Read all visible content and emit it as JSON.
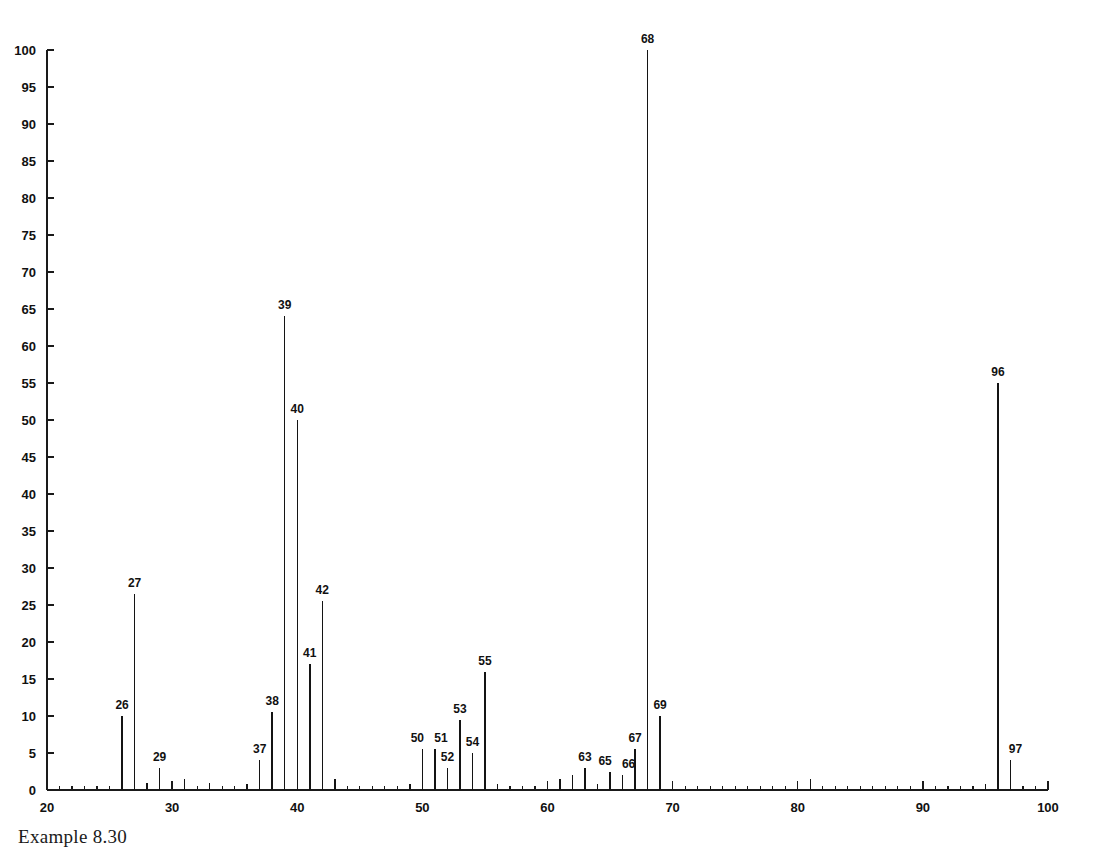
{
  "figure": {
    "caption": "Example 8.30",
    "background_color": "#ffffff",
    "trace_color": "#141414",
    "axis_color": "#1a1a1a"
  },
  "chart_data": {
    "type": "bar",
    "subtype": "mass-spectrum-stick-plot",
    "title": "",
    "subtitle": "",
    "xlabel": "",
    "ylabel": "",
    "xlim": [
      20,
      100
    ],
    "ylim": [
      0,
      100
    ],
    "grid": false,
    "legend": null,
    "x_major_ticks": [
      20,
      30,
      40,
      50,
      60,
      70,
      80,
      90,
      100
    ],
    "x_major_tick_labels": [
      "20",
      "30",
      "40",
      "50",
      "60",
      "70",
      "80",
      "90",
      "100"
    ],
    "x_minor_tick_step": 1,
    "y_major_ticks": [
      0,
      5,
      10,
      15,
      20,
      25,
      30,
      35,
      40,
      45,
      50,
      55,
      60,
      65,
      70,
      75,
      80,
      85,
      90,
      95,
      100
    ],
    "y_major_tick_labels": [
      "0",
      "5",
      "10",
      "15",
      "20",
      "25",
      "30",
      "35",
      "40",
      "45",
      "50",
      "55",
      "60",
      "65",
      "70",
      "75",
      "80",
      "85",
      "90",
      "95",
      "100"
    ],
    "base_peak_mz": 68,
    "molecular_ion_mz": 96,
    "x": [
      26,
      27,
      28,
      29,
      31,
      33,
      36,
      37,
      38,
      39,
      40,
      41,
      42,
      43,
      49,
      50,
      51,
      52,
      53,
      54,
      55,
      56,
      61,
      62,
      63,
      64,
      65,
      66,
      67,
      68,
      69,
      81,
      95,
      96,
      97
    ],
    "values": [
      10.0,
      26.5,
      1.0,
      3.0,
      1.5,
      1.0,
      0.8,
      4.0,
      10.5,
      64.0,
      50.0,
      17.0,
      25.5,
      1.5,
      0.8,
      5.5,
      5.5,
      3.0,
      9.5,
      5.0,
      16.0,
      0.8,
      1.5,
      2.0,
      3.0,
      0.8,
      2.5,
      2.0,
      5.5,
      100.0,
      10.0,
      1.5,
      0.8,
      55.0,
      4.0
    ],
    "labeled_peaks": [
      {
        "mz": 26,
        "intensity": 10.0,
        "label": "26"
      },
      {
        "mz": 27,
        "intensity": 26.5,
        "label": "27"
      },
      {
        "mz": 29,
        "intensity": 3.0,
        "label": "29"
      },
      {
        "mz": 37,
        "intensity": 4.0,
        "label": "37"
      },
      {
        "mz": 38,
        "intensity": 10.5,
        "label": "38"
      },
      {
        "mz": 39,
        "intensity": 64.0,
        "label": "39"
      },
      {
        "mz": 40,
        "intensity": 50.0,
        "label": "40"
      },
      {
        "mz": 41,
        "intensity": 17.0,
        "label": "41"
      },
      {
        "mz": 42,
        "intensity": 25.5,
        "label": "42"
      },
      {
        "mz": 50,
        "intensity": 5.5,
        "label": "50"
      },
      {
        "mz": 51,
        "intensity": 5.5,
        "label": "51"
      },
      {
        "mz": 52,
        "intensity": 3.0,
        "label": "52"
      },
      {
        "mz": 53,
        "intensity": 9.5,
        "label": "53"
      },
      {
        "mz": 54,
        "intensity": 5.0,
        "label": "54"
      },
      {
        "mz": 55,
        "intensity": 16.0,
        "label": "55"
      },
      {
        "mz": 63,
        "intensity": 3.0,
        "label": "63"
      },
      {
        "mz": 65,
        "intensity": 2.5,
        "label": "65"
      },
      {
        "mz": 66,
        "intensity": 2.0,
        "label": "66"
      },
      {
        "mz": 67,
        "intensity": 5.5,
        "label": "67"
      },
      {
        "mz": 68,
        "intensity": 100.0,
        "label": "68"
      },
      {
        "mz": 69,
        "intensity": 10.0,
        "label": "69"
      },
      {
        "mz": 96,
        "intensity": 55.0,
        "label": "96"
      },
      {
        "mz": 97,
        "intensity": 4.0,
        "label": "97"
      }
    ]
  }
}
